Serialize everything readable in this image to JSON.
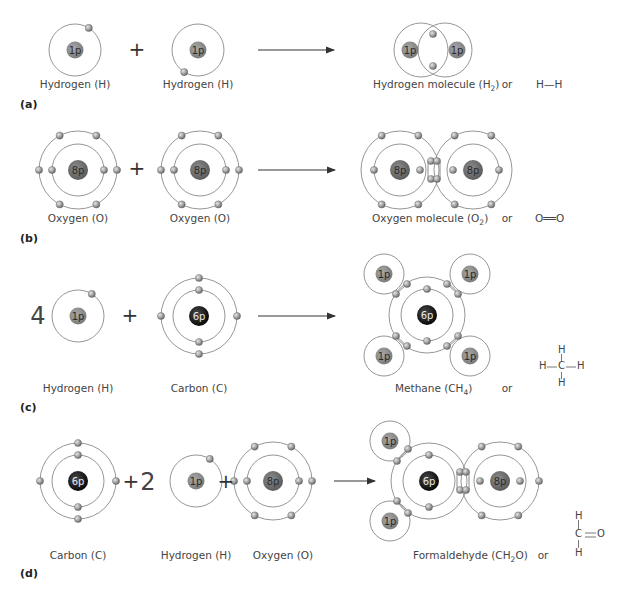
{
  "colors": {
    "orbit": "#8a8a8a",
    "electron": "#9a9a9a",
    "hydrogen_nucleus": "#8c8c8c",
    "oxygen_nucleus": "#707070",
    "carbon_nucleus": "#1a1a1a",
    "text": "#444444"
  },
  "panels": [
    {
      "id": "a",
      "label": "(a)",
      "reactants": [
        {
          "name": "Hydrogen (H)",
          "nucleus": "1p"
        },
        {
          "name": "Hydrogen (H)",
          "nucleus": "1p"
        }
      ],
      "operators": [
        "+"
      ],
      "product": {
        "name": "Hydrogen molecule (H",
        "sub": "2",
        "close": ")"
      },
      "or": "or",
      "structural": "H—H"
    },
    {
      "id": "b",
      "label": "(b)",
      "reactants": [
        {
          "name": "Oxygen (O)",
          "nucleus": "8p"
        },
        {
          "name": "Oxygen (O)",
          "nucleus": "8p"
        }
      ],
      "operators": [
        "+"
      ],
      "product": {
        "name": "Oxygen molecule (O",
        "sub": "2",
        "close": ")"
      },
      "or": "or",
      "structural": "O══O"
    },
    {
      "id": "c",
      "label": "(c)",
      "coefficient": "4",
      "reactants": [
        {
          "name": "Hydrogen (H)",
          "nucleus": "1p"
        },
        {
          "name": "Carbon (C)",
          "nucleus": "6p"
        }
      ],
      "operators": [
        "+"
      ],
      "product": {
        "name": "Methane (CH",
        "sub": "4",
        "close": ")"
      },
      "or": "or",
      "structural": {
        "top": "H",
        "middle": "H—C—H",
        "bottom": "H",
        "left": "H",
        "center": "C",
        "right": "H"
      }
    },
    {
      "id": "d",
      "label": "(d)",
      "coefficient": "2",
      "reactants": [
        {
          "name": "Carbon (C)",
          "nucleus": "6p"
        },
        {
          "name": "Hydrogen (H)",
          "nucleus": "1p"
        },
        {
          "name": "Oxygen (O)",
          "nucleus": "8p"
        }
      ],
      "operators": [
        "+",
        "+"
      ],
      "product": {
        "name": "Formaldehyde (CH",
        "sub": "2",
        "close": "O)"
      },
      "or": "or",
      "structural": {
        "top": "H",
        "center": "C",
        "right": "O",
        "bottom": "H"
      }
    }
  ]
}
